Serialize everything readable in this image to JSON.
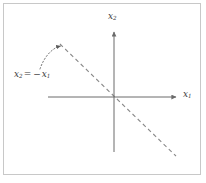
{
  "figure": {
    "width": 206,
    "height": 183,
    "background_color": "#ffffff",
    "border_color": "#c8c8c8"
  },
  "axes": {
    "line_color": "#6b6b6b",
    "horizontal": {
      "label": "x",
      "label_subscript": "1",
      "start_x": 48,
      "end_x": 178,
      "y": 97
    },
    "vertical": {
      "label": "x",
      "label_subscript": "2",
      "x": 114,
      "start_y": 152,
      "end_y": 30
    }
  },
  "line": {
    "color": "#8a8a8a",
    "style": "dashed",
    "slope": -1,
    "intercept": 0,
    "equation_var_left": "x",
    "equation_sub_left": "2",
    "equation_operator": "=",
    "equation_sign": "−",
    "equation_var_right": "x",
    "equation_sub_right": "1",
    "start_x": 60,
    "start_y": 44,
    "end_x": 176,
    "end_y": 156
  },
  "annotation": {
    "arrow_color": "#6b6b6b",
    "arrow_style": "dotted-curved",
    "from_x": 40,
    "from_y": 69,
    "to_x": 62,
    "to_y": 46
  }
}
